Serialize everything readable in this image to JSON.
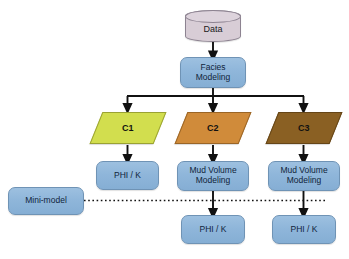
{
  "diagram": {
    "type": "flowchart",
    "background": "#ffffff",
    "colors": {
      "process_fill": "#8fb6da",
      "process_stroke": "#6f93b5",
      "data_fill": "#d8cdd6",
      "data_stroke": "#8d8391",
      "c1_fill": "#d2de4e",
      "c2_fill": "#d08b3a",
      "c3_fill": "#8a6023",
      "connector": "#111111"
    }
  },
  "nodes": {
    "data": {
      "label": "Data",
      "shape": "cylinder"
    },
    "facies_modeling": {
      "label": "Facies\nModeling",
      "line1": "Facies",
      "line2": "Modeling",
      "shape": "process"
    },
    "c1": {
      "label": "C1",
      "shape": "parallelogram",
      "fill": "#d2de4e"
    },
    "c2": {
      "label": "C2",
      "shape": "parallelogram",
      "fill": "#d08b3a"
    },
    "c3": {
      "label": "C3",
      "shape": "parallelogram",
      "fill": "#8a6023"
    },
    "phik_c1": {
      "label": "PHI / K",
      "shape": "process"
    },
    "mud_volume_c2": {
      "line1": "Mud Volume",
      "line2": "Modeling",
      "shape": "process"
    },
    "mud_volume_c3": {
      "line1": "Mud Volume",
      "line2": "Modeling",
      "shape": "process"
    },
    "mini_model": {
      "label": "Mini-model",
      "shape": "process"
    },
    "phik_c2": {
      "label": "PHI / K",
      "shape": "process"
    },
    "phik_c3": {
      "label": "PHI / K",
      "shape": "process"
    }
  },
  "edges": [
    {
      "from": "data",
      "to": "facies_modeling",
      "style": "solid-arrow"
    },
    {
      "from": "facies_modeling",
      "to": "c1",
      "style": "solid-arrow-branch"
    },
    {
      "from": "facies_modeling",
      "to": "c2",
      "style": "solid-arrow-branch"
    },
    {
      "from": "facies_modeling",
      "to": "c3",
      "style": "solid-arrow-branch"
    },
    {
      "from": "c1",
      "to": "phik_c1",
      "style": "solid-arrow"
    },
    {
      "from": "c2",
      "to": "mud_volume_c2",
      "style": "solid-arrow"
    },
    {
      "from": "c3",
      "to": "mud_volume_c3",
      "style": "solid-arrow"
    },
    {
      "from": "mud_volume_c2",
      "to": "phik_c2",
      "style": "solid-arrow"
    },
    {
      "from": "mud_volume_c3",
      "to": "phik_c3",
      "style": "solid-arrow"
    },
    {
      "from": "mini_model",
      "to": "phik_c2",
      "style": "dotted"
    },
    {
      "from": "mini_model",
      "to": "phik_c3",
      "style": "dotted"
    }
  ]
}
